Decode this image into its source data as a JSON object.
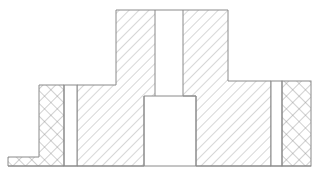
{
  "diagram": {
    "type": "mechanical-cross-section",
    "colors": {
      "background": "#ffffff",
      "line": "#8a8a8a",
      "hatch": "#9a9a9a"
    },
    "regions": [
      {
        "name": "left-insulation",
        "hatch": "crosshatch"
      },
      {
        "name": "left-gap",
        "hatch": "none"
      },
      {
        "name": "left-body",
        "hatch": "diagonal"
      },
      {
        "name": "center-bore",
        "hatch": "none"
      },
      {
        "name": "right-body",
        "hatch": "diagonal"
      },
      {
        "name": "right-gap",
        "hatch": "none"
      },
      {
        "name": "right-insulation",
        "hatch": "crosshatch"
      },
      {
        "name": "bottom-tab",
        "hatch": "crosshatch"
      }
    ]
  }
}
